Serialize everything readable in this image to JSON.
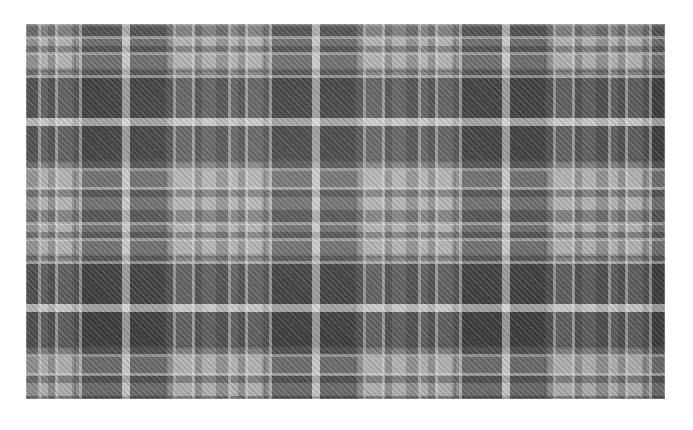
{
  "image": {
    "subject": "plaid-tartan-fabric-swatch",
    "description": "Close-up photograph of a grey checked plaid woven fabric swatch on a white background",
    "canvas_width": 693,
    "canvas_height": 430,
    "background_color": "#ffffff"
  },
  "swatch": {
    "label": "Grey plaid woven fabric",
    "left": 26,
    "top": 24,
    "width": 639,
    "height": 375,
    "weave": "2/2 twill",
    "orientation": "horizontal swatch, slight upward tilt"
  },
  "palette": {
    "lightest_check": "#b0b0b0",
    "mid_check": "#8d8d8d",
    "dark_check": "#626262",
    "darkest_check": "#4a4a4a",
    "pinstripe": "#e8e8e8",
    "grid_rule": "#3c3c3c",
    "background": "#ffffff"
  },
  "pattern": {
    "type": "tartan-check",
    "warp_repeat_px": 190,
    "weft_repeat_px": 186,
    "tone_levels": 4,
    "warp_sett": [
      {
        "tone": "mid",
        "start": 0,
        "end": 14
      },
      {
        "tone": "light",
        "start": 14,
        "end": 22
      },
      {
        "tone": "mid",
        "start": 22,
        "end": 30
      },
      {
        "tone": "light",
        "start": 30,
        "end": 48
      },
      {
        "tone": "mid",
        "start": 48,
        "end": 56
      },
      {
        "tone": "dark",
        "start": 56,
        "end": 96
      },
      {
        "tone": "light",
        "start": 96,
        "end": 104
      },
      {
        "tone": "dark",
        "start": 104,
        "end": 140
      },
      {
        "tone": "mid",
        "start": 140,
        "end": 150
      },
      {
        "tone": "light",
        "start": 150,
        "end": 168
      },
      {
        "tone": "mid",
        "start": 168,
        "end": 176
      },
      {
        "tone": "light",
        "start": 176,
        "end": 190
      }
    ],
    "weft_sett": [
      {
        "tone": "mid",
        "start": 0,
        "end": 14
      },
      {
        "tone": "light",
        "start": 14,
        "end": 22
      },
      {
        "tone": "mid",
        "start": 22,
        "end": 30
      },
      {
        "tone": "light",
        "start": 30,
        "end": 46
      },
      {
        "tone": "mid",
        "start": 46,
        "end": 54
      },
      {
        "tone": "dark",
        "start": 54,
        "end": 94
      },
      {
        "tone": "light",
        "start": 94,
        "end": 102
      },
      {
        "tone": "dark",
        "start": 102,
        "end": 137
      },
      {
        "tone": "mid",
        "start": 137,
        "end": 147
      },
      {
        "tone": "light",
        "start": 147,
        "end": 165
      },
      {
        "tone": "mid",
        "start": 165,
        "end": 173
      },
      {
        "tone": "light",
        "start": 173,
        "end": 186
      }
    ],
    "pinstripe_count_per_repeat": 6,
    "dark_block_size_px": "36 x 35",
    "twill_angle_deg": 45
  }
}
